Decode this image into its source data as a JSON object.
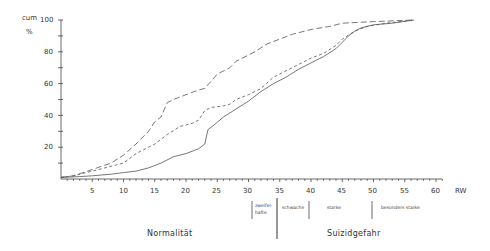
{
  "chart_data": {
    "type": "line",
    "title": "",
    "xlabel": "RW",
    "ylabel": "cum %",
    "xlim": [
      0,
      62
    ],
    "ylim": [
      0,
      100
    ],
    "x_ticks": [
      5,
      10,
      15,
      20,
      25,
      30,
      35,
      40,
      45,
      50,
      55,
      60
    ],
    "y_ticks": [
      20,
      40,
      60,
      80,
      100
    ],
    "grid": false,
    "legend": null,
    "series": [
      {
        "name": "long-dash curve",
        "style": "long-dash",
        "points": [
          [
            0,
            1
          ],
          [
            2,
            2
          ],
          [
            5,
            6
          ],
          [
            8,
            10
          ],
          [
            10,
            15
          ],
          [
            12,
            22
          ],
          [
            14,
            30
          ],
          [
            15,
            36
          ],
          [
            16,
            39
          ],
          [
            17,
            48
          ],
          [
            18,
            50
          ],
          [
            20,
            53
          ],
          [
            22,
            56
          ],
          [
            23,
            57
          ],
          [
            25,
            66
          ],
          [
            27,
            70
          ],
          [
            28,
            74
          ],
          [
            30,
            78
          ],
          [
            31,
            80
          ],
          [
            33,
            85
          ],
          [
            35,
            88
          ],
          [
            37,
            91
          ],
          [
            40,
            94
          ],
          [
            43,
            96
          ],
          [
            45,
            98
          ],
          [
            50,
            99
          ],
          [
            56.5,
            100
          ]
        ]
      },
      {
        "name": "short-dash curve",
        "style": "short-dash",
        "points": [
          [
            0,
            1
          ],
          [
            2,
            2
          ],
          [
            5,
            5
          ],
          [
            8,
            8
          ],
          [
            10,
            10
          ],
          [
            12,
            16
          ],
          [
            14,
            20
          ],
          [
            15,
            22
          ],
          [
            17,
            28
          ],
          [
            19,
            33
          ],
          [
            21,
            35
          ],
          [
            22,
            37
          ],
          [
            23,
            43
          ],
          [
            24,
            45
          ],
          [
            26,
            46
          ],
          [
            27,
            47
          ],
          [
            28,
            50
          ],
          [
            30,
            53
          ],
          [
            32,
            57
          ],
          [
            34,
            64
          ],
          [
            36,
            68
          ],
          [
            38,
            72
          ],
          [
            40,
            76
          ],
          [
            42,
            79
          ],
          [
            44,
            84
          ],
          [
            45,
            88
          ],
          [
            47,
            93
          ],
          [
            49,
            96
          ],
          [
            52,
            98
          ],
          [
            56.5,
            100
          ]
        ]
      },
      {
        "name": "solid curve",
        "style": "solid",
        "points": [
          [
            0,
            1
          ],
          [
            3,
            1.5
          ],
          [
            5,
            2
          ],
          [
            8,
            3
          ],
          [
            10,
            4
          ],
          [
            12,
            5
          ],
          [
            14,
            7
          ],
          [
            16,
            10
          ],
          [
            18,
            14
          ],
          [
            20,
            16
          ],
          [
            22,
            19
          ],
          [
            23,
            22
          ],
          [
            23.5,
            31
          ],
          [
            24.5,
            34
          ],
          [
            26,
            39
          ],
          [
            28,
            44
          ],
          [
            30,
            49
          ],
          [
            32,
            55
          ],
          [
            34,
            60
          ],
          [
            36,
            64
          ],
          [
            38,
            69
          ],
          [
            40,
            73
          ],
          [
            42,
            77
          ],
          [
            44,
            82
          ],
          [
            45,
            86
          ],
          [
            46,
            90
          ],
          [
            47,
            93
          ],
          [
            48,
            95
          ],
          [
            50,
            97
          ],
          [
            53,
            98
          ],
          [
            56.5,
            100
          ]
        ]
      }
    ],
    "annotations": {
      "regions": [
        {
          "label": "zweifel-\nhafte",
          "from": 30.5,
          "to": 34.5
        },
        {
          "label": "schwache",
          "from": 34.5,
          "to": 40
        },
        {
          "label": "starke",
          "from": 40,
          "to": 50
        },
        {
          "label": "besonders starke",
          "from": 50,
          "to": 62
        }
      ],
      "groups": [
        {
          "label": "Normalität",
          "from": 0,
          "to": 34.5
        },
        {
          "label": "Suizidgefahr",
          "from": 34.5,
          "to": 62
        }
      ]
    }
  },
  "axis": {
    "y_unit_top": "cum",
    "y_unit_bottom": "%",
    "x_unit": "RW",
    "y_tick_labels": [
      "100",
      "80",
      "60",
      "40",
      "20"
    ],
    "x_tick_labels": [
      "5",
      "10",
      "15",
      "20",
      "25",
      "30",
      "35",
      "40",
      "45",
      "50",
      "55",
      "60"
    ]
  },
  "regions": {
    "zweifel_line1": "zweifel-",
    "zweifel_line2": "hafte",
    "schwache": "schwache",
    "starke": "starke",
    "besonders_starke": "besonders  starke"
  },
  "groups": {
    "normal": "Normalität",
    "suicide": "Suizidgefahr"
  }
}
